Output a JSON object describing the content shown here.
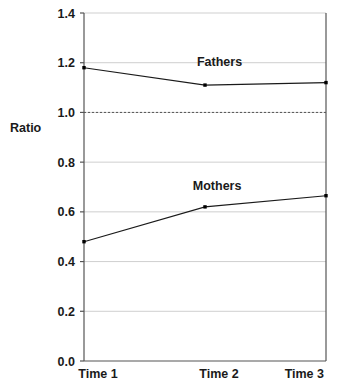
{
  "chart_data": {
    "type": "line",
    "title": "",
    "xlabel": "",
    "ylabel": "Ratio",
    "categories": [
      "Time 1",
      "Time 2",
      "Time 3"
    ],
    "series": [
      {
        "name": "Fathers",
        "values": [
          1.18,
          1.11,
          1.12
        ]
      },
      {
        "name": "Mothers",
        "values": [
          0.48,
          0.62,
          0.665
        ]
      }
    ],
    "ylim": [
      0.0,
      1.4
    ],
    "yticks": [
      "0.0",
      "0.2",
      "0.4",
      "0.6",
      "0.8",
      "1.0",
      "1.2",
      "1.4"
    ],
    "ytick_values": [
      0.0,
      0.2,
      0.4,
      0.6,
      0.8,
      1.0,
      1.2,
      1.4
    ],
    "grid": true,
    "legend": "inline-annotations",
    "annotations": [
      {
        "text": "Fathers",
        "x": 1.12,
        "y": 1.205
      },
      {
        "text": "Mothers",
        "x": 1.1,
        "y": 0.705
      }
    ],
    "reference_line": {
      "value": 1.0,
      "style": "dotted",
      "label": ""
    },
    "colors": {
      "line": "#1a1a1a",
      "marker": "#000000",
      "grid": "#cfcfcf",
      "axis": "#555555",
      "reference": "#555555",
      "background": "#ffffff",
      "text": "#1a1a1a"
    },
    "plot_area": {
      "left": 84,
      "right": 326,
      "top": 13,
      "bottom": 361
    }
  }
}
